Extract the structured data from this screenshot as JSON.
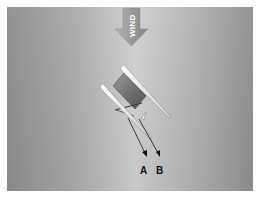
{
  "diagram": {
    "wind_label": "WIND",
    "vector_labels": [
      "A",
      "B"
    ],
    "colors": {
      "background_outer": "#8e8e8e",
      "background_center": "#cfcfcf",
      "border": "#ffffff",
      "arrow_fill": "#9a9a9a",
      "hull": "#efefef",
      "trampoline": "#6f6f6f",
      "vector_line": "#2a2a2a",
      "label": "#111111"
    }
  }
}
